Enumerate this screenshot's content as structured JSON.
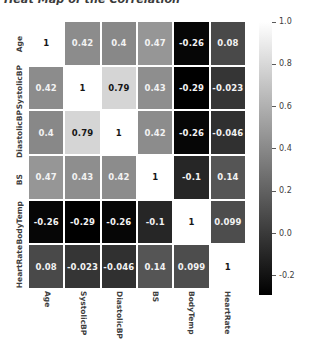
{
  "chart_data": {
    "type": "heatmap",
    "title": "Heat Map of the Correlation",
    "xlabel": "",
    "ylabel": "",
    "grid": true,
    "legend_position": "right",
    "colormap": "gray",
    "categories": [
      "Age",
      "SystolicBP",
      "DiastolicBP",
      "BS",
      "BodyTemp",
      "HeartRate"
    ],
    "x_tick_labels": [
      "Age",
      "SystolicBP",
      "DiastolicBP",
      "BS",
      "BodyTemp",
      "HeartRate"
    ],
    "y_tick_labels": [
      "Age",
      "SystolicBP",
      "DiastolicBP",
      "BS",
      "BodyTemp",
      "HeartRate"
    ],
    "vmin": -0.29,
    "vmax": 1.0,
    "colorbar": {
      "ticks": [
        1.0,
        0.8,
        0.6,
        0.4,
        0.2,
        0.0,
        -0.2
      ],
      "tick_labels": [
        "1.0",
        "0.8",
        "0.6",
        "0.4",
        "0.2",
        "0.0",
        "-0.2"
      ],
      "top_color": "#ffffff",
      "bottom_color": "#000000"
    },
    "values": [
      [
        1,
        0.42,
        0.4,
        0.47,
        -0.26,
        0.08
      ],
      [
        0.42,
        1,
        0.79,
        0.43,
        -0.29,
        -0.023
      ],
      [
        0.4,
        0.79,
        1,
        0.42,
        -0.26,
        -0.046
      ],
      [
        0.47,
        0.43,
        0.42,
        1,
        -0.1,
        0.14
      ],
      [
        -0.26,
        -0.29,
        -0.26,
        -0.1,
        1,
        0.099
      ],
      [
        0.08,
        -0.023,
        -0.046,
        0.14,
        0.099,
        1
      ]
    ],
    "cell_labels": [
      [
        "1",
        "0.42",
        "0.4",
        "0.47",
        "-0.26",
        "0.08"
      ],
      [
        "0.42",
        "1",
        "0.79",
        "0.43",
        "-0.29",
        "-0.023"
      ],
      [
        "0.4",
        "0.79",
        "1",
        "0.42",
        "-0.26",
        "-0.046"
      ],
      [
        "0.47",
        "0.43",
        "0.42",
        "1",
        "-0.1",
        "0.14"
      ],
      [
        "-0.26",
        "-0.29",
        "-0.26",
        "-0.1",
        "1",
        "0.099"
      ],
      [
        "0.08",
        "-0.023",
        "-0.046",
        "0.14",
        "0.099",
        "1"
      ]
    ]
  }
}
